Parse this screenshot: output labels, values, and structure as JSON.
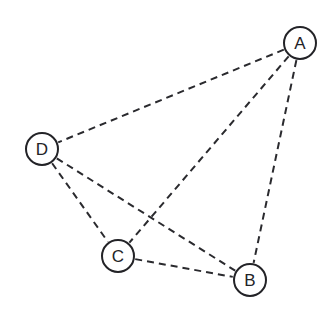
{
  "diagram": {
    "type": "node-link-diagram",
    "width": 334,
    "height": 316,
    "background_color": "#ffffff",
    "style": {
      "edge_color": "#2a2a2e",
      "edge_width": 2,
      "edge_dash": "7 5",
      "node_stroke_color": "#232327",
      "node_stroke_width": 2,
      "node_fill_color": "#ffffff",
      "label_color": "#232327",
      "node_radius": 16
    },
    "nodes": [
      {
        "id": "A",
        "label": "A",
        "cx": 300,
        "cy": 43,
        "r": 16
      },
      {
        "id": "B",
        "label": "B",
        "cx": 250,
        "cy": 280,
        "r": 16
      },
      {
        "id": "C",
        "label": "C",
        "cx": 118,
        "cy": 256,
        "r": 16
      },
      {
        "id": "D",
        "label": "D",
        "cx": 42,
        "cy": 149,
        "r": 16
      }
    ],
    "edges": [
      {
        "id": "A-D",
        "source": "A",
        "target": "D",
        "style": "dashed"
      },
      {
        "id": "A-C",
        "source": "A",
        "target": "C",
        "style": "dashed"
      },
      {
        "id": "A-B",
        "source": "A",
        "target": "B",
        "style": "dashed"
      },
      {
        "id": "D-C",
        "source": "D",
        "target": "C",
        "style": "dashed"
      },
      {
        "id": "D-B",
        "source": "D",
        "target": "B",
        "style": "dashed"
      },
      {
        "id": "C-B",
        "source": "C",
        "target": "B",
        "style": "dashed"
      }
    ]
  }
}
